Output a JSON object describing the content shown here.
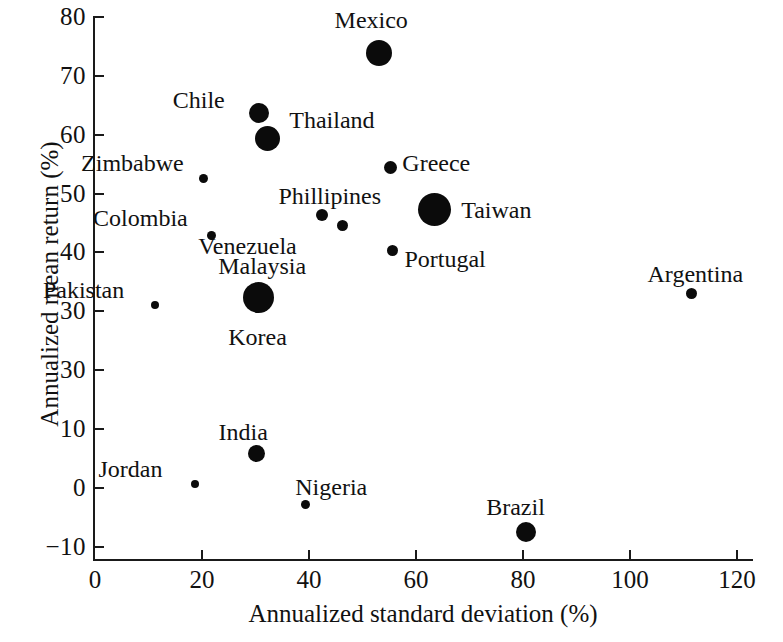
{
  "chart_data": {
    "type": "scatter",
    "title": "",
    "xlabel": "Annualized standard deviation (%)",
    "ylabel": "Annualized mean return (%)",
    "xlim": [
      0,
      123
    ],
    "ylim": [
      -10,
      82
    ],
    "xticks": [
      0,
      20,
      40,
      60,
      80,
      100,
      120
    ],
    "xtick_labels": [
      "0",
      "20",
      "40",
      "60",
      "80",
      "100",
      "120"
    ],
    "yticks": [
      -10,
      0,
      10,
      20,
      30,
      40,
      50,
      60,
      70,
      80
    ],
    "ytick_labels": [
      "−10",
      "0",
      "10",
      "30",
      "30",
      "40",
      "50",
      "60",
      "70",
      "80"
    ],
    "grid": false,
    "legend": null,
    "marker_color": "#0b0b0b",
    "note_on_ticks": "Y-axis tick at value 20 is printed as '30' in the source scan (duplicate label).",
    "points": [
      {
        "name": "Mexico",
        "x": 53.0,
        "y": 73.8,
        "size": 26,
        "label_dx": -44,
        "label_dy": -46
      },
      {
        "name": "Chile",
        "x": 30.6,
        "y": 63.6,
        "size": 20,
        "label_dx": -86,
        "label_dy": -26
      },
      {
        "name": "Thailand",
        "x": 32.2,
        "y": 59.3,
        "size": 25,
        "label_dx": 22,
        "label_dy": -32
      },
      {
        "name": "Greece",
        "x": 55.2,
        "y": 54.4,
        "size": 13,
        "label_dx": 12,
        "label_dy": -18
      },
      {
        "name": "Zimbabwe",
        "x": 20.2,
        "y": 52.6,
        "size": 9,
        "label_dx": -122,
        "label_dy": -28
      },
      {
        "name": "Taiwan",
        "x": 63.4,
        "y": 47.2,
        "size": 33,
        "label_dx": 27,
        "label_dy": -13
      },
      {
        "name": "Phillipines",
        "x": 42.5,
        "y": 46.3,
        "size": 12,
        "label_dx": -44,
        "label_dy": -32
      },
      {
        "name": "Venezuela",
        "x": 46.2,
        "y": 44.6,
        "size": 11,
        "label_dx": -144,
        "label_dy": 8
      },
      {
        "name": "Colombia",
        "x": 21.7,
        "y": 42.9,
        "size": 9,
        "label_dx": -118,
        "label_dy": -30
      },
      {
        "name": "Portugal",
        "x": 55.6,
        "y": 40.3,
        "size": 11,
        "label_dx": 12,
        "label_dy": -5
      },
      {
        "name": "Argentina",
        "x": 111.5,
        "y": 33.1,
        "size": 11,
        "label_dx": -44,
        "label_dy": -32
      },
      {
        "name": "Malaysia",
        "x": 30.5,
        "y": 32.3,
        "size": 31,
        "label_dx": -40,
        "label_dy": -45
      },
      {
        "name": "Korea",
        "x": 30.5,
        "y": 32.3,
        "size": 31,
        "label_dx": -30,
        "label_dy": 26
      },
      {
        "name": "Pakistan",
        "x": 11.2,
        "y": 31.1,
        "size": 8,
        "label_dx": -112,
        "label_dy": -28
      },
      {
        "name": "India",
        "x": 30.2,
        "y": 5.9,
        "size": 17,
        "label_dx": -38,
        "label_dy": -34
      },
      {
        "name": "Jordan",
        "x": 18.6,
        "y": 0.6,
        "size": 8,
        "label_dx": -96,
        "label_dy": -28
      },
      {
        "name": "Nigeria",
        "x": 39.3,
        "y": -2.8,
        "size": 9,
        "label_dx": -10,
        "label_dy": -30
      },
      {
        "name": "Brazil",
        "x": 80.6,
        "y": -7.5,
        "size": 20,
        "label_dx": -40,
        "label_dy": -38
      }
    ]
  }
}
